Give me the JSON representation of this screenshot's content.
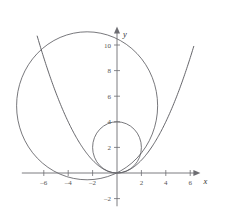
{
  "chart_data": {
    "type": "line",
    "title": "",
    "xlabel": "x",
    "ylabel": "y",
    "grid": false,
    "legend": "none",
    "xlim": [
      -7.8,
      7.0
    ],
    "ylim": [
      -2.6,
      11.6
    ],
    "xticks": [
      -6,
      -4,
      -2,
      2,
      4,
      6
    ],
    "yticks": [
      2,
      4,
      6,
      8,
      10,
      -2
    ],
    "xtick_labels": [
      "–6",
      "–4",
      "–2",
      "2",
      "4",
      "6"
    ],
    "ytick_labels": [
      "2",
      "4",
      "6",
      "8",
      "10",
      "–2"
    ],
    "axis_arrows": true,
    "series": [
      {
        "name": "parabola",
        "kind": "parabola",
        "equation": "y = x^2/4",
        "coefficient": 0.25,
        "vertex": [
          0,
          0
        ],
        "x_range": [
          -6.55,
          6.3
        ],
        "points": [
          [
            -6.55,
            10.73
          ],
          [
            -6.0,
            9.0
          ],
          [
            -5.0,
            6.25
          ],
          [
            -4.0,
            4.0
          ],
          [
            -3.0,
            2.25
          ],
          [
            -2.0,
            1.0
          ],
          [
            -1.0,
            0.25
          ],
          [
            0.0,
            0.0
          ],
          [
            1.0,
            0.25
          ],
          [
            2.0,
            1.0
          ],
          [
            3.0,
            2.25
          ],
          [
            4.0,
            4.0
          ],
          [
            5.0,
            6.25
          ],
          [
            6.0,
            9.0
          ],
          [
            6.3,
            9.92
          ]
        ],
        "color": "#55555a",
        "width": 0.9
      },
      {
        "name": "large-circle",
        "kind": "circle",
        "center": [
          -2.45,
          5.25
        ],
        "radius": 5.78,
        "color": "#55555a",
        "width": 0.8
      },
      {
        "name": "small-circle",
        "kind": "circle",
        "center": [
          0,
          2
        ],
        "radius": 2,
        "color": "#55555a",
        "width": 0.8
      }
    ],
    "colors": {
      "curve": "#55555a",
      "axis": "#6d6d72",
      "tick_label": "#555555",
      "axis_label": "#333333",
      "background": "#ffffff"
    }
  },
  "figure": {
    "origin_px": [
      117,
      173
    ],
    "unit_px": [
      12.2,
      12.8
    ]
  }
}
